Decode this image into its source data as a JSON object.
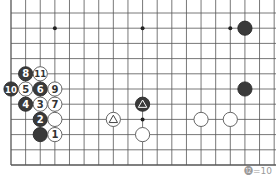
{
  "board": {
    "background": "#ffffff",
    "line_color": "#555555",
    "grid": {
      "x0": 11,
      "dx": 14.62,
      "cols": 19,
      "y0": 13,
      "dy": 15.2,
      "rows": 11,
      "left_edge": true,
      "bottom_edge": true,
      "top_edge": false,
      "right_edge": false
    },
    "star_points": [
      {
        "col": 3,
        "row": 1
      },
      {
        "col": 9,
        "row": 1
      },
      {
        "col": 15,
        "row": 1
      },
      {
        "col": 9,
        "row": 7
      }
    ],
    "stones": [
      {
        "color": "black",
        "col": 16,
        "row": 1,
        "label": ""
      },
      {
        "color": "black",
        "col": 16,
        "row": 5,
        "label": ""
      },
      {
        "color": "black",
        "col": 1,
        "row": 4,
        "label": "8"
      },
      {
        "color": "white",
        "col": 2,
        "row": 4,
        "label": "11"
      },
      {
        "color": "black",
        "col": 0,
        "row": 5,
        "label": "10"
      },
      {
        "color": "white",
        "col": 1,
        "row": 5,
        "label": "5"
      },
      {
        "color": "black",
        "col": 2,
        "row": 5,
        "label": "6"
      },
      {
        "color": "white",
        "col": 3,
        "row": 5,
        "label": "9"
      },
      {
        "color": "black",
        "col": 1,
        "row": 6,
        "label": "4"
      },
      {
        "color": "white",
        "col": 2,
        "row": 6,
        "label": "3"
      },
      {
        "color": "white",
        "col": 3,
        "row": 6,
        "label": "7"
      },
      {
        "color": "black",
        "col": 2,
        "row": 7,
        "label": "2"
      },
      {
        "color": "white",
        "col": 3,
        "row": 7,
        "label": ""
      },
      {
        "color": "black",
        "col": 2,
        "row": 8,
        "label": ""
      },
      {
        "color": "white",
        "col": 3,
        "row": 8,
        "label": "1"
      },
      {
        "color": "black",
        "col": 9,
        "row": 6,
        "label": "",
        "mark": "triangle"
      },
      {
        "color": "white",
        "col": 7,
        "row": 7,
        "label": "",
        "mark": "triangle"
      },
      {
        "color": "white",
        "col": 9,
        "row": 8,
        "label": ""
      },
      {
        "color": "white",
        "col": 13,
        "row": 7,
        "label": ""
      },
      {
        "color": "white",
        "col": 15,
        "row": 7,
        "label": ""
      }
    ],
    "stone_colors": {
      "black": "#3a3a3a",
      "white": "#ffffff",
      "black_text": "#ffffff",
      "white_text": "#333333"
    }
  },
  "caption": {
    "text": "⓬=10"
  }
}
